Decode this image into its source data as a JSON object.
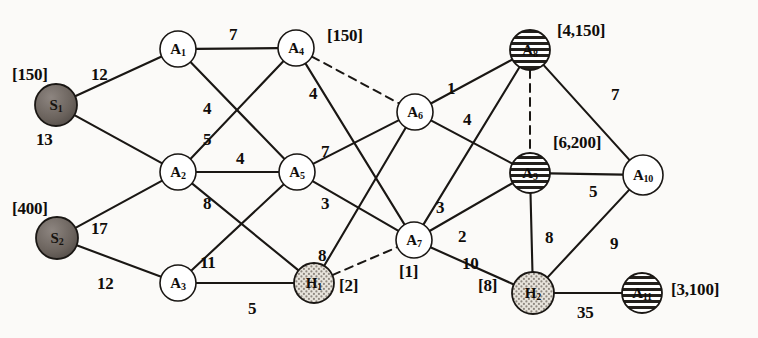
{
  "diagram": {
    "nodes": [
      {
        "id": "S1",
        "label": "S",
        "sub": "1",
        "x": 56,
        "y": 105,
        "r": 21,
        "style": "dark",
        "bracket": "[150]",
        "bx": 12,
        "by": 66
      },
      {
        "id": "S2",
        "label": "S",
        "sub": "2",
        "x": 57,
        "y": 238,
        "r": 21,
        "style": "dark",
        "bracket": "[400]",
        "bx": 12,
        "by": 200
      },
      {
        "id": "A1",
        "label": "A",
        "sub": "1",
        "x": 178,
        "y": 49,
        "r": 18,
        "style": "plain",
        "bracket": "",
        "bx": 0,
        "by": 0
      },
      {
        "id": "A2",
        "label": "A",
        "sub": "2",
        "x": 178,
        "y": 172,
        "r": 18,
        "style": "plain",
        "bracket": "",
        "bx": 0,
        "by": 0
      },
      {
        "id": "A3",
        "label": "A",
        "sub": "3",
        "x": 178,
        "y": 283,
        "r": 18,
        "style": "plain",
        "bracket": "",
        "bx": 0,
        "by": 0
      },
      {
        "id": "A4",
        "label": "A",
        "sub": "4",
        "x": 296,
        "y": 48,
        "r": 18,
        "style": "plain",
        "bracket": "[150]",
        "bx": 327,
        "by": 27
      },
      {
        "id": "A5",
        "label": "A",
        "sub": "5",
        "x": 297,
        "y": 172,
        "r": 18,
        "style": "plain",
        "bracket": "",
        "bx": 0,
        "by": 0
      },
      {
        "id": "H1",
        "label": "H",
        "sub": "1",
        "x": 314,
        "y": 283,
        "r": 20,
        "style": "dotted",
        "bracket": "[2]",
        "bx": 339,
        "by": 277
      },
      {
        "id": "A6",
        "label": "A",
        "sub": "6",
        "x": 415,
        "y": 112,
        "r": 18,
        "style": "plain",
        "bracket": "",
        "bx": 0,
        "by": 0
      },
      {
        "id": "A7",
        "label": "A",
        "sub": "7",
        "x": 414,
        "y": 240,
        "r": 18,
        "style": "plain",
        "bracket": "[1]",
        "bx": 399,
        "by": 263
      },
      {
        "id": "A8",
        "label": "A",
        "sub": "8",
        "x": 530,
        "y": 50,
        "r": 20,
        "style": "striped",
        "bracket": "[4,150]",
        "bx": 557,
        "by": 22
      },
      {
        "id": "A9",
        "label": "A",
        "sub": "9",
        "x": 530,
        "y": 173,
        "r": 20,
        "style": "striped",
        "bracket": "[6,200]",
        "bx": 553,
        "by": 134
      },
      {
        "id": "A10",
        "label": "A",
        "sub": "10",
        "x": 643,
        "y": 175,
        "r": 20,
        "style": "plain",
        "bracket": "",
        "bx": 0,
        "by": 0
      },
      {
        "id": "H2",
        "label": "H",
        "sub": "2",
        "x": 533,
        "y": 293,
        "r": 21,
        "style": "dotted",
        "bracket": "[8]",
        "bx": 478,
        "by": 277
      },
      {
        "id": "A11",
        "label": "A",
        "sub": "11",
        "x": 642,
        "y": 293,
        "r": 20,
        "style": "striped",
        "bracket": "[3,100]",
        "bx": 671,
        "by": 281
      }
    ],
    "edges": [
      {
        "from": "S1",
        "to": "A1",
        "weight": "12",
        "lx": 91,
        "ly": 66,
        "dashed": false
      },
      {
        "from": "S1",
        "to": "A2",
        "weight": "13",
        "lx": 36,
        "ly": 131,
        "dashed": false
      },
      {
        "from": "S2",
        "to": "A2",
        "weight": "17",
        "lx": 91,
        "ly": 220,
        "dashed": false
      },
      {
        "from": "S2",
        "to": "A3",
        "weight": "12",
        "lx": 97,
        "ly": 275,
        "dashed": false
      },
      {
        "from": "A1",
        "to": "A4",
        "weight": "7",
        "lx": 229,
        "ly": 26,
        "dashed": false
      },
      {
        "from": "A1",
        "to": "A5",
        "weight": "4",
        "lx": 203,
        "ly": 100,
        "dashed": false
      },
      {
        "from": "A2",
        "to": "A4",
        "weight": "5",
        "lx": 203,
        "ly": 131,
        "dashed": false
      },
      {
        "from": "A2",
        "to": "A5",
        "weight": "4",
        "lx": 236,
        "ly": 150,
        "dashed": false
      },
      {
        "from": "A2",
        "to": "H1",
        "weight": "8",
        "lx": 203,
        "ly": 195,
        "dashed": false
      },
      {
        "from": "A3",
        "to": "A5",
        "weight": "11",
        "lx": 200,
        "ly": 254,
        "dashed": false
      },
      {
        "from": "A3",
        "to": "H1",
        "weight": "5",
        "lx": 248,
        "ly": 300,
        "dashed": false
      },
      {
        "from": "A4",
        "to": "A6",
        "weight": "",
        "lx": 0,
        "ly": 0,
        "dashed": true
      },
      {
        "from": "A4",
        "to": "A7",
        "weight": "4",
        "lx": 309,
        "ly": 85,
        "dashed": false
      },
      {
        "from": "A5",
        "to": "A6",
        "weight": "7",
        "lx": 321,
        "ly": 143,
        "dashed": false
      },
      {
        "from": "A5",
        "to": "A7",
        "weight": "3",
        "lx": 321,
        "ly": 195,
        "dashed": false
      },
      {
        "from": "H1",
        "to": "A6",
        "weight": "8",
        "lx": 318,
        "ly": 247,
        "dashed": false
      },
      {
        "from": "H1",
        "to": "A7",
        "weight": "",
        "lx": 0,
        "ly": 0,
        "dashed": true
      },
      {
        "from": "A6",
        "to": "A8",
        "weight": "1",
        "lx": 447,
        "ly": 80,
        "dashed": false
      },
      {
        "from": "A6",
        "to": "A9",
        "weight": "4",
        "lx": 463,
        "ly": 111,
        "dashed": false
      },
      {
        "from": "A7",
        "to": "A8",
        "weight": "3",
        "lx": 436,
        "ly": 199,
        "dashed": false
      },
      {
        "from": "A7",
        "to": "A9",
        "weight": "2",
        "lx": 458,
        "ly": 228,
        "dashed": false
      },
      {
        "from": "A7",
        "to": "H2",
        "weight": "10",
        "lx": 462,
        "ly": 255,
        "dashed": false
      },
      {
        "from": "A8",
        "to": "A9",
        "weight": "",
        "lx": 0,
        "ly": 0,
        "dashed": true
      },
      {
        "from": "A8",
        "to": "A10",
        "weight": "7",
        "lx": 611,
        "ly": 86,
        "dashed": false
      },
      {
        "from": "A9",
        "to": "A10",
        "weight": "5",
        "lx": 589,
        "ly": 183,
        "dashed": false
      },
      {
        "from": "A9",
        "to": "H2",
        "weight": "8",
        "lx": 545,
        "ly": 229,
        "dashed": false
      },
      {
        "from": "A10",
        "to": "H2",
        "weight": "9",
        "lx": 610,
        "ly": 235,
        "dashed": false
      },
      {
        "from": "H2",
        "to": "A11",
        "weight": "35",
        "lx": 577,
        "ly": 304,
        "dashed": false
      }
    ],
    "colors": {
      "background": "#fbfaf8",
      "line": "#1a1714",
      "node_plain_fill": "#ffffff",
      "node_dark_fill": "#6d6560",
      "node_dotted_fill": "#ded9d1",
      "node_striped_fill": "#ffffff",
      "text": "#100d0a"
    }
  }
}
